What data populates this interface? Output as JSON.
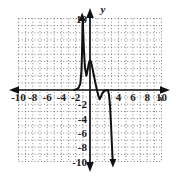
{
  "chart_data": {
    "type": "line",
    "title": "",
    "xlabel": "x",
    "ylabel": "y",
    "xlim": [
      -11,
      11
    ],
    "ylim": [
      -11,
      11
    ],
    "grid": true,
    "grid_style": "dotted",
    "grid_step": 1,
    "legend": "none",
    "x_tick_labels": [
      "-10",
      "-8",
      "-6",
      "-4",
      "-2",
      "4",
      "6",
      "8",
      "10"
    ],
    "x_tick_values": [
      -10,
      -8,
      -6,
      -4,
      -2,
      4,
      6,
      8,
      10
    ],
    "y_tick_labels": [
      "10",
      "-2",
      "-4",
      "-6",
      "-8",
      "-10"
    ],
    "y_tick_values": [
      10,
      -2,
      -4,
      -6,
      -8,
      -10
    ],
    "axis_arrows": [
      "left",
      "right",
      "up",
      "down"
    ],
    "curve_arrow_up_at": [
      -1.1,
      10
    ],
    "curve_arrow_down_at": [
      3.2,
      -10
    ],
    "series": [
      {
        "name": "curve",
        "x": [
          -2.2,
          -1.9,
          -1.6,
          -1.35,
          -1.2,
          -1.12,
          -1.08,
          -1.05,
          -1.0,
          -0.95,
          -0.85,
          -0.7,
          -0.5,
          -0.3,
          -0.15,
          0.0,
          0.15,
          0.35,
          0.55,
          0.75,
          0.9,
          1.05,
          1.2,
          1.35,
          1.5,
          1.7,
          1.9,
          2.1,
          2.3,
          2.5,
          2.65,
          2.8,
          2.95,
          3.05,
          3.15,
          3.2
        ],
        "y": [
          0.0,
          0.1,
          0.3,
          0.9,
          2.6,
          5.0,
          7.2,
          9.0,
          10.0,
          8.2,
          5.6,
          3.1,
          2.0,
          3.0,
          3.8,
          4.2,
          3.9,
          3.0,
          2.0,
          1.0,
          0.3,
          -0.3,
          -0.9,
          -1.3,
          -1.0,
          -0.5,
          -0.2,
          -0.1,
          -0.05,
          -0.05,
          -0.6,
          -2.2,
          -5.0,
          -7.4,
          -9.4,
          -10.0
        ]
      }
    ]
  },
  "figure": {
    "x_axis_label": "x",
    "y_axis_label": "y"
  }
}
